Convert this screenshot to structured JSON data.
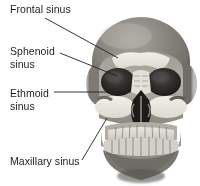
{
  "figure": {
    "view": "anterior (frontal) view",
    "background_color": "#ffffff",
    "text_color": "#1d1d1d",
    "leader_line_color": "#231f20",
    "width": 200,
    "height": 186
  },
  "labels": [
    {
      "id": "frontal",
      "text": "Frontal sinus",
      "name": "label-frontal-sinus",
      "x": 10,
      "y": 3,
      "leader": {
        "x1": 45,
        "y1": 18,
        "x2": 118,
        "y2": 58
      }
    },
    {
      "id": "sphenoid",
      "text": "Sphenoid\nsinus",
      "name": "label-sphenoid-sinus",
      "x": 10,
      "y": 45,
      "leader": {
        "x1": 60,
        "y1": 53,
        "x2": 117,
        "y2": 76
      }
    },
    {
      "id": "ethmoid",
      "text": "Ethmoid\nsinus",
      "name": "label-ethmoid-sinus",
      "x": 10,
      "y": 87,
      "leader": {
        "x1": 54,
        "y1": 92,
        "x2": 131,
        "y2": 92
      }
    },
    {
      "id": "maxillary",
      "text": "Maxillary sinus",
      "name": "label-maxillary-sinus",
      "x": 10,
      "y": 155,
      "leader": {
        "x1": 82,
        "y1": 160,
        "x2": 107,
        "y2": 118
      }
    }
  ],
  "anatomy": {
    "structures": [
      "cranium",
      "frontal bone",
      "orbit-left",
      "orbit-right",
      "frontal sinus",
      "sphenoid sinus",
      "ethmoid sinus",
      "maxillary sinus",
      "nasal cavity",
      "zygomatic arch",
      "maxilla",
      "mandible",
      "upper teeth",
      "lower teeth"
    ],
    "sinus_fill_color": "#e8e6de",
    "bone_light": "#d8d5cd",
    "bone_mid": "#a7a49c",
    "bone_dark": "#6e6b65",
    "cavity_dark": "#201f1e"
  }
}
